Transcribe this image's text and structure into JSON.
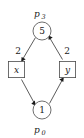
{
  "diagram": {
    "type": "petri-net",
    "title": "",
    "places": [
      {
        "id": "p3",
        "name": "p",
        "subscript": "3",
        "tokens": "5",
        "position": "top",
        "cx": 42,
        "cy": 31,
        "r": 9,
        "label_x": 42,
        "label_y": 15
      },
      {
        "id": "p0",
        "name": "p",
        "subscript": "0",
        "tokens": "1",
        "position": "bottom",
        "cx": 42,
        "cy": 110,
        "r": 9,
        "label_x": 42,
        "label_y": 133
      }
    ],
    "transitions": [
      {
        "id": "x",
        "label": "x",
        "position": "left",
        "x": 8,
        "y": 61,
        "w": 17,
        "h": 17
      },
      {
        "id": "y",
        "label": "y",
        "position": "right",
        "x": 59,
        "y": 61,
        "w": 17,
        "h": 17
      }
    ],
    "edges": [
      {
        "id": "p3-to-x",
        "from": "p3",
        "to": "x",
        "weight": "2",
        "weight_x": 18,
        "weight_y": 51,
        "x1": 35,
        "y1": 37,
        "x2": 22,
        "y2": 59
      },
      {
        "id": "x-to-p0",
        "from": "x",
        "to": "p0",
        "weight": "",
        "x1": 22,
        "y1": 80,
        "x2": 35,
        "y2": 104
      },
      {
        "id": "p0-to-y",
        "from": "p0",
        "to": "y",
        "weight": "",
        "x1": 49,
        "y1": 104,
        "x2": 63,
        "y2": 80
      },
      {
        "id": "y-to-p3",
        "from": "y",
        "to": "p3",
        "weight": "2",
        "weight_x": 67,
        "weight_y": 51,
        "x1": 63,
        "y1": 59,
        "x2": 49,
        "y2": 37
      }
    ],
    "colors": {
      "stroke": "#4a4a4a",
      "text": "#1a1a1a",
      "background": "#ffffff",
      "arrow": "#1a1a1a"
    }
  }
}
